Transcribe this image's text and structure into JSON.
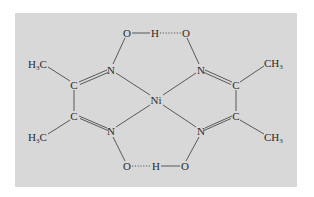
{
  "diagram": {
    "type": "structural-formula",
    "colors": {
      "panel_background": "#d8d8d8",
      "ink": "#2a2a2a",
      "page_background": "#ffffff"
    },
    "atoms": {
      "o_top_left": "O",
      "h_top": "H",
      "o_top_right": "O",
      "n_upper_left": "N",
      "n_upper_right": "N",
      "c_upper_left": "C",
      "c_upper_right": "C",
      "ni_center": "Ni",
      "c_lower_left": "C",
      "c_lower_right": "C",
      "n_lower_left": "N",
      "n_lower_right": "N",
      "o_bottom_left": "O",
      "h_bottom": "H",
      "o_bottom_right": "O"
    },
    "methyl_groups": {
      "upper_left": {
        "main": "H",
        "sub": "3",
        "tail": "C"
      },
      "lower_left": {
        "main": "H",
        "sub": "3",
        "tail": "C"
      },
      "upper_right": {
        "main": "CH",
        "sub": "3"
      },
      "lower_right": {
        "main": "CH",
        "sub": "3"
      }
    },
    "bonds": [
      {
        "from": "o_top_left",
        "to": "h_top",
        "kind": "single"
      },
      {
        "from": "h_top",
        "to": "o_top_right",
        "kind": "hydrogen"
      },
      {
        "from": "o_top_left",
        "to": "n_upper_left",
        "kind": "single"
      },
      {
        "from": "o_top_right",
        "to": "n_upper_right",
        "kind": "single"
      },
      {
        "from": "n_upper_left",
        "to": "c_upper_left",
        "kind": "double"
      },
      {
        "from": "n_upper_right",
        "to": "c_upper_right",
        "kind": "double"
      },
      {
        "from": "c_upper_left",
        "to": "c_lower_left",
        "kind": "single"
      },
      {
        "from": "c_upper_right",
        "to": "c_lower_right",
        "kind": "single"
      },
      {
        "from": "c_lower_left",
        "to": "n_lower_left",
        "kind": "double"
      },
      {
        "from": "c_lower_right",
        "to": "n_lower_right",
        "kind": "double"
      },
      {
        "from": "n_upper_left",
        "to": "ni_center",
        "kind": "coordinate"
      },
      {
        "from": "n_upper_right",
        "to": "ni_center",
        "kind": "coordinate"
      },
      {
        "from": "n_lower_left",
        "to": "ni_center",
        "kind": "coordinate"
      },
      {
        "from": "n_lower_right",
        "to": "ni_center",
        "kind": "coordinate"
      },
      {
        "from": "n_lower_left",
        "to": "o_bottom_left",
        "kind": "single"
      },
      {
        "from": "n_lower_right",
        "to": "o_bottom_right",
        "kind": "single"
      },
      {
        "from": "o_bottom_left",
        "to": "h_bottom",
        "kind": "hydrogen"
      },
      {
        "from": "h_bottom",
        "to": "o_bottom_right",
        "kind": "single"
      },
      {
        "from": "c_upper_left",
        "to": "methyl_upper_left",
        "kind": "single"
      },
      {
        "from": "c_lower_left",
        "to": "methyl_lower_left",
        "kind": "single"
      },
      {
        "from": "c_upper_right",
        "to": "methyl_upper_right",
        "kind": "single"
      },
      {
        "from": "c_lower_right",
        "to": "methyl_lower_right",
        "kind": "single"
      }
    ]
  }
}
